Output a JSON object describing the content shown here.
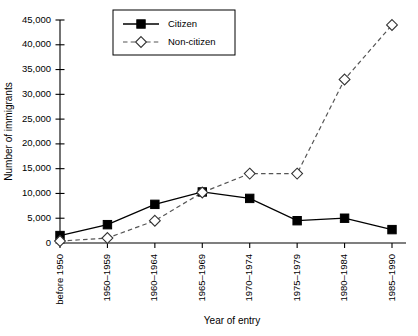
{
  "chart_data": {
    "type": "line",
    "title": "",
    "xlabel": "Year of entry",
    "ylabel": "Number of immigrants",
    "categories": [
      "before 1950",
      "1950–1959",
      "1960–1964",
      "1965–1969",
      "1970–1974",
      "1975–1979",
      "1980–1984",
      "1985–1990"
    ],
    "series": [
      {
        "name": "Citizen",
        "values": [
          1500,
          3700,
          7800,
          10300,
          9000,
          4500,
          5000,
          2700
        ],
        "marker": "filled-square",
        "line": "solid",
        "color": "#000000"
      },
      {
        "name": "Non-citizen",
        "values": [
          400,
          1000,
          4500,
          10200,
          14000,
          14000,
          33000,
          44000
        ],
        "marker": "open-diamond",
        "line": "dashed",
        "color": "#555555"
      }
    ],
    "ylim": [
      0,
      45000
    ],
    "yticks": [
      0,
      5000,
      10000,
      15000,
      20000,
      25000,
      30000,
      35000,
      40000,
      45000
    ],
    "ytick_labels": [
      "0",
      "5,000",
      "10,000",
      "15,000",
      "20,000",
      "25,000",
      "30,000",
      "35,000",
      "40,000",
      "45,000"
    ],
    "grid": false,
    "legend_position": "top-center"
  },
  "axes": {
    "x_title": "Year of entry",
    "y_title": "Number of immigrants"
  },
  "legend": {
    "entries": [
      {
        "label": "Citizen"
      },
      {
        "label": "Non-citizen"
      }
    ]
  }
}
